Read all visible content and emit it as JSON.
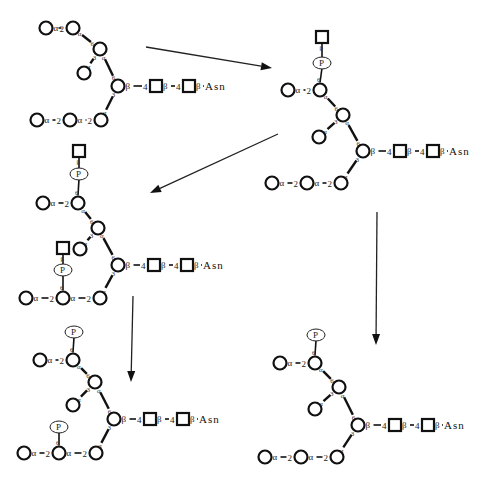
{
  "diagram": {
    "colors": {
      "stroke": "#111111",
      "background": "#ffffff"
    },
    "common_labels": {
      "asn": "Asn",
      "phosphate": "P",
      "alpha_2": "α—2",
      "beta_4": "β—4",
      "beta_asn": "β—",
      "alpha": "α",
      "beta": "β",
      "link_3": "3",
      "link_6": "6"
    },
    "structures": [
      {
        "id": "structure-1",
        "name": "high-mannose-glycan",
        "origin": [
          0,
          0
        ],
        "nodes": {
          "A0": [
            46,
            28
          ],
          "A1": [
            73,
            28
          ],
          "B": [
            100,
            49
          ],
          "C": [
            84,
            73
          ],
          "D": [
            118,
            86
          ],
          "S1": [
            156,
            86
          ],
          "S2": [
            189,
            86
          ],
          "E": [
            101,
            120
          ],
          "F": [
            70,
            120
          ],
          "G": [
            37,
            120
          ]
        },
        "asn_pos": [
          205,
          90
        ],
        "phospho_upper": null,
        "phospho_lower": null
      },
      {
        "id": "structure-2",
        "name": "glcnac-phospho-glycan-one-arm",
        "nodes": {
          "A0": [
            288,
            90
          ],
          "A1": [
            320,
            90
          ],
          "B": [
            343,
            115
          ],
          "C": [
            319,
            137
          ],
          "D": [
            363,
            151
          ],
          "S1": [
            400,
            151
          ],
          "S2": [
            433,
            151
          ],
          "E": [
            341,
            183
          ],
          "F": [
            307,
            183
          ],
          "G": [
            272,
            183
          ]
        },
        "asn_pos": [
          449,
          155
        ],
        "phospho_upper": {
          "p": [
            322,
            63
          ],
          "square": [
            322,
            37
          ]
        },
        "phospho_lower": null
      },
      {
        "id": "structure-3",
        "name": "glcnac-phospho-glycan-two-arms",
        "nodes": {
          "A0": [
            43,
            203
          ],
          "A1": [
            78,
            203
          ],
          "B": [
            98,
            228
          ],
          "C": [
            80,
            249
          ],
          "D": [
            118,
            265
          ],
          "S1": [
            154,
            265
          ],
          "S2": [
            187,
            265
          ],
          "E": [
            100,
            298
          ],
          "F": [
            63,
            298
          ],
          "G": [
            26,
            298
          ]
        },
        "asn_pos": [
          203,
          269
        ],
        "phospho_upper": {
          "p": [
            79,
            174
          ],
          "square": [
            79,
            151
          ]
        },
        "phospho_lower": {
          "p": [
            63,
            270
          ],
          "square": [
            63,
            248
          ]
        }
      },
      {
        "id": "structure-4",
        "name": "diphospho-glycan",
        "nodes": {
          "A0": [
            40,
            360
          ],
          "A1": [
            73,
            360
          ],
          "B": [
            95,
            382
          ],
          "C": [
            73,
            405
          ],
          "D": [
            114,
            419
          ],
          "S1": [
            150,
            419
          ],
          "S2": [
            183,
            419
          ],
          "E": [
            96,
            453
          ],
          "F": [
            59,
            453
          ],
          "G": [
            24,
            453
          ]
        },
        "asn_pos": [
          199,
          423
        ],
        "phospho_upper": {
          "p": [
            74,
            332
          ],
          "square": null
        },
        "phospho_lower": {
          "p": [
            59,
            427
          ],
          "square": null
        }
      },
      {
        "id": "structure-5",
        "name": "monophospho-glycan",
        "nodes": {
          "A0": [
            280,
            363
          ],
          "A1": [
            315,
            363
          ],
          "B": [
            339,
            387
          ],
          "C": [
            315,
            409
          ],
          "D": [
            358,
            425
          ],
          "S1": [
            395,
            425
          ],
          "S2": [
            428,
            425
          ],
          "E": [
            337,
            457
          ],
          "F": [
            301,
            457
          ],
          "G": [
            265,
            457
          ]
        },
        "asn_pos": [
          444,
          429
        ],
        "phospho_upper": {
          "p": [
            316,
            335
          ],
          "square": null
        },
        "phospho_lower": null
      }
    ],
    "arrows": [
      {
        "id": "arrow-1-to-2",
        "from": [
          146,
          47
        ],
        "to": [
          272,
          68
        ]
      },
      {
        "id": "arrow-2-to-3",
        "from": [
          278,
          134
        ],
        "to": [
          150,
          193
        ]
      },
      {
        "id": "arrow-3-to-4",
        "from": [
          133,
          296
        ],
        "to": [
          131,
          382
        ]
      },
      {
        "id": "arrow-2-to-5",
        "from": [
          377,
          212
        ],
        "to": [
          376,
          345
        ]
      }
    ]
  }
}
